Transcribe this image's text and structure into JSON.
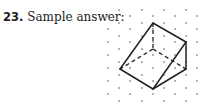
{
  "problem": {
    "number": "23.",
    "label": "Sample answer:"
  },
  "figure": {
    "dot_color": "#555555",
    "line_color": "#222222",
    "vertices": {
      "top": [
        153,
        23
      ],
      "right_top": [
        186,
        42
      ],
      "right_bottom": [
        186,
        69
      ],
      "bottom": [
        153,
        89
      ],
      "left": [
        120,
        69
      ],
      "hidden": [
        153,
        49
      ]
    }
  }
}
